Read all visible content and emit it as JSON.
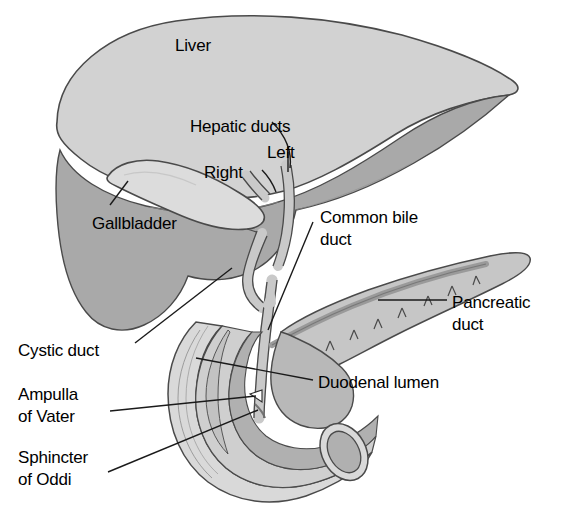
{
  "figure": {
    "type": "anatomical-illustration",
    "background_color": "#ffffff",
    "line_color": "#1a1a1a"
  },
  "palette": {
    "liver_superior": "#d2d2d2",
    "liver_inferior": "#a9a9a9",
    "gallbladder": "#dcdcdc",
    "duct": "#c9c9c9",
    "duct_shade": "#a0a0a0",
    "pancreas": "#c6c6c6",
    "pancreatic_duct": "#9a9a9a",
    "duodenum_outer": "#d9d9d9",
    "duodenum_mucosa": "#b0b0b0",
    "duodenum_lumen_dark": "#9d9d9d",
    "outline": "#4a4a4a"
  },
  "labels": [
    {
      "id": "liver",
      "text": "Liver",
      "x": 175,
      "y": 36,
      "leader": false
    },
    {
      "id": "hepatic-ducts",
      "text": "Hepatic ducts",
      "x": 190,
      "y": 117,
      "leader": true
    },
    {
      "id": "left",
      "text": "Left",
      "x": 267,
      "y": 143,
      "leader": true
    },
    {
      "id": "right",
      "text": "Right",
      "x": 204,
      "y": 163,
      "leader": true
    },
    {
      "id": "gallbladder",
      "text": "Gallbladder",
      "x": 92,
      "y": 214,
      "leader": true
    },
    {
      "id": "common-bile-duct-l1",
      "text": "Common bile",
      "x": 320,
      "y": 208,
      "leader": true
    },
    {
      "id": "common-bile-duct-l2",
      "text": "duct",
      "x": 320,
      "y": 230,
      "leader": false
    },
    {
      "id": "pancreatic-duct-l1",
      "text": "Pancreatic",
      "x": 452,
      "y": 293,
      "leader": true
    },
    {
      "id": "pancreatic-duct-l2",
      "text": "duct",
      "x": 452,
      "y": 315,
      "leader": false
    },
    {
      "id": "cystic-duct",
      "text": "Cystic duct",
      "x": 18,
      "y": 341,
      "leader": true
    },
    {
      "id": "duodenal-lumen",
      "text": "Duodenal lumen",
      "x": 318,
      "y": 373,
      "leader": true
    },
    {
      "id": "ampulla-l1",
      "text": "Ampulla",
      "x": 18,
      "y": 385,
      "leader": false
    },
    {
      "id": "ampulla-l2",
      "text": "of Vater",
      "x": 18,
      "y": 407,
      "leader": true
    },
    {
      "id": "sphincter-l1",
      "text": "Sphincter",
      "x": 18,
      "y": 448,
      "leader": false
    },
    {
      "id": "sphincter-l2",
      "text": "of Oddi",
      "x": 18,
      "y": 470,
      "leader": true
    }
  ],
  "structures": [
    {
      "id": "liver",
      "name": "Liver"
    },
    {
      "id": "gallbladder",
      "name": "Gallbladder"
    },
    {
      "id": "right-hepatic-duct",
      "name": "Right hepatic duct"
    },
    {
      "id": "left-hepatic-duct",
      "name": "Left hepatic duct"
    },
    {
      "id": "cystic-duct",
      "name": "Cystic duct"
    },
    {
      "id": "common-bile-duct",
      "name": "Common bile duct"
    },
    {
      "id": "pancreas",
      "name": "Pancreas"
    },
    {
      "id": "pancreatic-duct",
      "name": "Pancreatic duct"
    },
    {
      "id": "duodenum",
      "name": "Duodenum"
    },
    {
      "id": "duodenal-lumen",
      "name": "Duodenal lumen"
    },
    {
      "id": "ampulla-of-vater",
      "name": "Ampulla of Vater"
    },
    {
      "id": "sphincter-of-oddi",
      "name": "Sphincter of Oddi"
    }
  ]
}
